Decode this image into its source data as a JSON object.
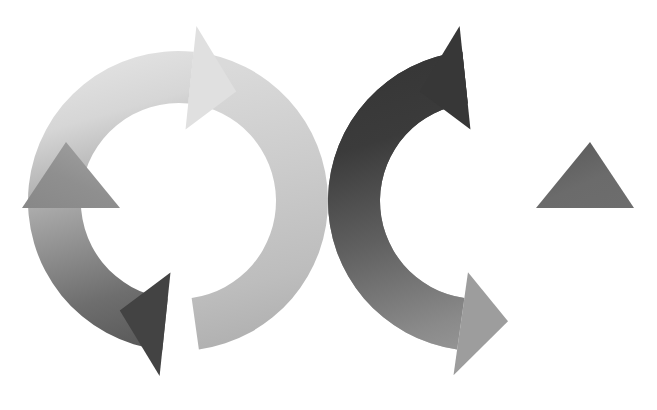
{
  "document": {
    "title": "Two Interlocking Circular Arrow Cycles",
    "background_color": "#ffffff",
    "width": 657,
    "height": 410,
    "text_content": "",
    "has_text": false
  },
  "graphic": {
    "type": "vector-illustration",
    "subject": "two interlocking circular arrow loops forming an infinity / recycle style diagram",
    "style": "flat grayscale with linear gradients, no outlines",
    "palette": {
      "lightest": "#e6e6e6",
      "light": "#d2d2d2",
      "light_mid": "#b4b4b4",
      "mid": "#9a9a9a",
      "mid_dark": "#7d7d7d",
      "dark": "#5a5a5a",
      "darker": "#454545",
      "darkest": "#353535",
      "background": "#ffffff"
    },
    "rings": [
      {
        "id": "left-ring",
        "name": "left-cycle-ring",
        "center_x": 178,
        "center_y": 201,
        "outer_radius": 150,
        "inner_radius": 98,
        "band_width": 52,
        "rotation_direction": "clockwise",
        "gradient_from": "#e6e6e6",
        "gradient_to": "#454545",
        "arrowheads": [
          {
            "id": "left-ring-top-arrow",
            "position": "top",
            "points": "right",
            "tip_x": 275,
            "tip_y": 33,
            "color": "#e0e0e0"
          },
          {
            "id": "left-ring-bottom-arrow",
            "position": "bottom",
            "points": "left",
            "tip_x": 77,
            "tip_y": 372,
            "color": "#424242"
          },
          {
            "id": "left-ring-west-arrow",
            "position": "west",
            "points": "up",
            "tip_x": 33,
            "tip_y": 202,
            "color": "#8c8c8c"
          }
        ]
      },
      {
        "id": "right-ring",
        "name": "right-cycle-ring",
        "center_x": 478,
        "center_y": 201,
        "outer_radius": 150,
        "inner_radius": 98,
        "band_width": 52,
        "rotation_direction": "counter-clockwise",
        "gradient_from": "#353535",
        "gradient_to": "#b9b9b9",
        "arrowheads": [
          {
            "id": "right-ring-top-arrow",
            "position": "top",
            "points": "left",
            "tip_x": 381,
            "tip_y": 33,
            "color": "#383838"
          },
          {
            "id": "right-ring-bottom-arrow",
            "position": "bottom",
            "points": "right",
            "tip_x": 579,
            "tip_y": 372,
            "color": "#9c9c9c"
          },
          {
            "id": "right-ring-east-arrow",
            "position": "east",
            "points": "up",
            "tip_x": 623,
            "tip_y": 202,
            "color": "#6e6e6e"
          }
        ]
      }
    ],
    "overlap": {
      "description": "rings interlock near x=320; the light band of the left ring passes in front at the crossing",
      "crossing_x": 322,
      "crossing_y": 201,
      "front_band": "left-ring-right-side"
    }
  }
}
